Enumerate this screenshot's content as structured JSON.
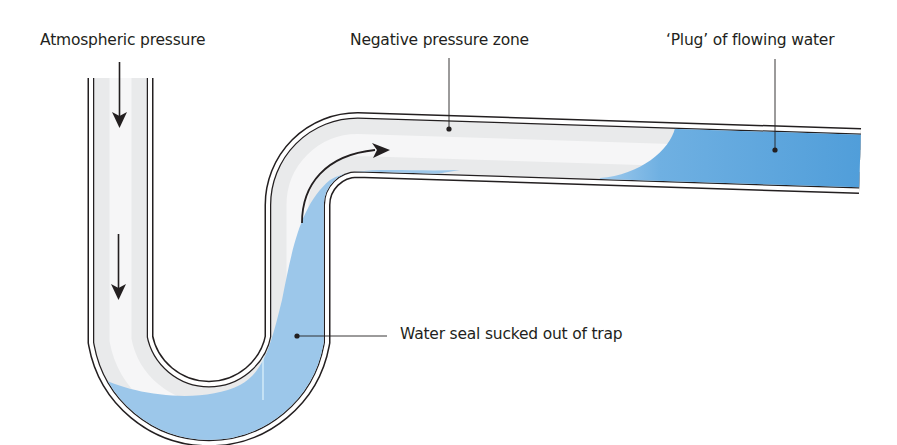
{
  "diagram": {
    "labels": {
      "atmospheric": "Atmospheric pressure",
      "negative": "Negative pressure zone",
      "plug": "‘Plug’ of flowing water",
      "seal": "Water seal sucked out of trap"
    },
    "colors": {
      "pipe_wall": "#231f20",
      "pipe_interior": "#e6e7e8",
      "water": "#9cc7ea",
      "water_deep": "#5aa3dc",
      "text": "#231f20"
    },
    "arrows": [
      {
        "name": "downward-flow-arrow-top",
        "direction": "down"
      },
      {
        "name": "downward-flow-arrow-bottom",
        "direction": "down"
      },
      {
        "name": "upward-curved-flow-arrow",
        "direction": "up-right"
      }
    ]
  }
}
